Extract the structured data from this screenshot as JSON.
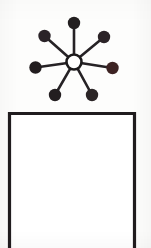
{
  "figure": {
    "background_color": "#fdfdfc",
    "ink_color": "#1c1a1b"
  },
  "star_diagram": {
    "label": "star-network",
    "hub": {
      "label": "hub",
      "cx": 48,
      "cy": 52,
      "radius": 7.5,
      "fill": "#ffffff",
      "stroke": "#1c1a1b",
      "stroke_width": 2.6
    },
    "spoke_stroke_width": 2.6,
    "spoke_color": "#262225",
    "node_count": 7,
    "nodes": [
      {
        "id": "node-top",
        "label": "top",
        "cx": 48,
        "cy": 13,
        "r": 6.2,
        "fill": "#231f20"
      },
      {
        "id": "node-upper-left",
        "label": "upper-left",
        "cx": 18.5,
        "cy": 26,
        "r": 6.2,
        "fill": "#2a2328"
      },
      {
        "id": "node-upper-right",
        "label": "upper-right",
        "cx": 78,
        "cy": 27,
        "r": 6.2,
        "fill": "#2b2327"
      },
      {
        "id": "node-left",
        "label": "left",
        "cx": 9.5,
        "cy": 57.5,
        "r": 6.2,
        "fill": "#221d1f"
      },
      {
        "id": "node-right",
        "label": "right",
        "cx": 86.5,
        "cy": 58,
        "r": 6.2,
        "fill": "#3d2323"
      },
      {
        "id": "node-bottom-left",
        "label": "bottom-left",
        "cx": 29,
        "cy": 85,
        "r": 6.2,
        "fill": "#231e20"
      },
      {
        "id": "node-bottom-right",
        "label": "bottom-right",
        "cx": 66,
        "cy": 85,
        "r": 6.2,
        "fill": "#2b2526"
      }
    ]
  },
  "frame_box": {
    "label": "open-rectangle",
    "stroke_color": "#201c1e",
    "stroke_width": 3.2,
    "open_side": "bottom",
    "left_x": 2.5,
    "right_x": 127.5,
    "top_y": 2.5,
    "bottom_y": 137,
    "fill": "#ffffff"
  }
}
